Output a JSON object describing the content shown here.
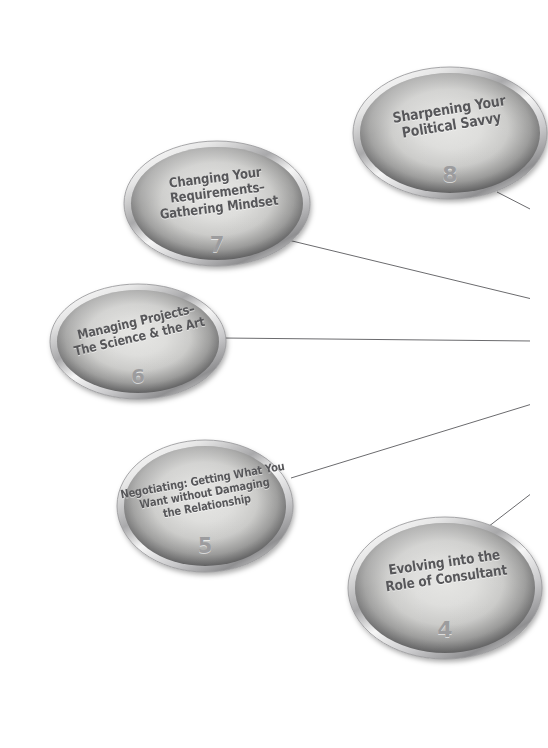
{
  "diagram": {
    "background_color": "#ffffff",
    "text_color": "#57575a",
    "number_color": "#9c9c9e",
    "bezel_light": "#f2f2f2",
    "bezel_dark": "#3a3a3c",
    "face_color": "#d9d9d7",
    "connector_color": "#6b6b6e"
  },
  "nodes": [
    {
      "id": "node-8",
      "number": "8",
      "lines": [
        "Sharpening Your",
        "Political Savvy"
      ],
      "label": "Sharpening Your Political Savvy",
      "geometry": {
        "left": 352,
        "top": 66,
        "width": 196,
        "height": 134
      },
      "text_rotation": -9,
      "font_size": 14.5,
      "number_font_size": 22,
      "text_offset_y": -16,
      "number_offset_y": 40
    },
    {
      "id": "node-7",
      "number": "7",
      "lines": [
        "Changing Your",
        "Requirements–",
        "Gathering Mindset"
      ],
      "label": "Changing Your Requirements-Gathering Mindset",
      "geometry": {
        "left": 123,
        "top": 140,
        "width": 188,
        "height": 127
      },
      "text_rotation": -7,
      "font_size": 13.5,
      "number_font_size": 21,
      "text_offset_y": -11,
      "number_offset_y": 40
    },
    {
      "id": "node-6",
      "number": "6",
      "lines": [
        "Managing Projects–",
        "The Science & the Art"
      ],
      "label": "Managing Projects - The Science and the Art",
      "geometry": {
        "left": 49,
        "top": 283,
        "width": 178,
        "height": 117
      },
      "text_rotation": -13,
      "font_size": 13,
      "number_font_size": 20,
      "text_offset_y": -12,
      "number_offset_y": 32
    },
    {
      "id": "node-5",
      "number": "5",
      "lines": [
        "Negotiating: Getting What You",
        "Want without Damaging",
        "the Relationship"
      ],
      "label": "Negotiating: Getting What You Want without Damaging the Relationship",
      "geometry": {
        "left": 116,
        "top": 439,
        "width": 178,
        "height": 134
      },
      "text_rotation": -10,
      "font_size": 11.5,
      "number_font_size": 21,
      "text_offset_y": -13,
      "number_offset_y": 38
    },
    {
      "id": "node-4",
      "number": "4",
      "lines": [
        "Evolving into the",
        "Role of Consultant"
      ],
      "label": "Evolving into the Role of Consultant",
      "geometry": {
        "left": 347,
        "top": 516,
        "width": 196,
        "height": 144
      },
      "text_rotation": -8,
      "font_size": 14,
      "number_font_size": 22,
      "text_offset_y": -17,
      "number_offset_y": 40
    }
  ],
  "connectors": [
    {
      "id": "connector-8",
      "from": "node-8",
      "x1": 497,
      "y1": 192,
      "x2": 532,
      "y2": 210
    },
    {
      "id": "connector-7",
      "from": "node-7",
      "x1": 288,
      "y1": 240,
      "x2": 532,
      "y2": 299
    },
    {
      "id": "connector-6",
      "from": "node-6",
      "x1": 222,
      "y1": 338,
      "x2": 532,
      "y2": 341
    },
    {
      "id": "connector-5",
      "from": "node-5",
      "x1": 291,
      "y1": 478,
      "x2": 532,
      "y2": 404
    },
    {
      "id": "connector-4",
      "from": "node-4",
      "x1": 484,
      "y1": 530,
      "x2": 532,
      "y2": 493
    }
  ]
}
